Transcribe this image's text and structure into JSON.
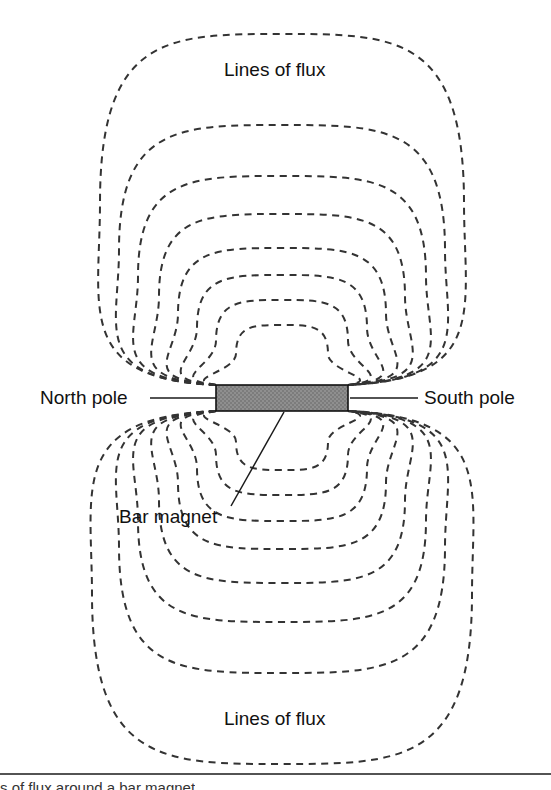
{
  "figure": {
    "kind": "magnetic-field-diagram",
    "background_color": "#ffffff",
    "line_color": "#333333",
    "magnet_fill": "#8a8a8a",
    "magnet_stroke": "#111111",
    "text_color": "#111111"
  },
  "labels": {
    "flux_top": "Lines of flux",
    "flux_bottom": "Lines of flux",
    "north_pole": "North pole",
    "south_pole": "South pole",
    "bar_magnet": "Bar magnet"
  },
  "caption": {
    "text": "s of flux around a bar magnet"
  },
  "chart_data": {
    "type": "diagram",
    "annotations": [
      {
        "text": "Lines of flux",
        "x": 275,
        "y": 70,
        "anchor": "middle"
      },
      {
        "text": "Lines of flux",
        "x": 275,
        "y": 719,
        "anchor": "middle"
      },
      {
        "text": "North pole",
        "x": 40,
        "y": 398,
        "anchor": "start"
      },
      {
        "text": "South pole",
        "x": 424,
        "y": 398,
        "anchor": "start"
      },
      {
        "text": "Bar magnet",
        "x": 119,
        "y": 517,
        "anchor": "start"
      }
    ],
    "magnet": {
      "x": 216,
      "y": 385,
      "width": 132,
      "height": 26,
      "fill": "#8a8a8a",
      "label": "Bar magnet",
      "north_end_x": 216,
      "south_end_x": 348
    },
    "leader_lines": [
      {
        "name": "north-pole-leader",
        "x1": 150,
        "y1": 398,
        "x2": 216,
        "y2": 398
      },
      {
        "name": "south-pole-leader",
        "x1": 350,
        "y1": 398,
        "x2": 418,
        "y2": 398
      },
      {
        "name": "bar-magnet-leader",
        "x1": 231,
        "y1": 506,
        "x2": 284,
        "y2": 412
      }
    ],
    "flux_loops_upper": [
      {
        "index": 1,
        "peak_y": 325,
        "half_width": 46
      },
      {
        "index": 2,
        "peak_y": 300,
        "half_width": 66
      },
      {
        "index": 3,
        "peak_y": 275,
        "half_width": 85
      },
      {
        "index": 4,
        "peak_y": 248,
        "half_width": 104
      },
      {
        "index": 5,
        "peak_y": 214,
        "half_width": 123
      },
      {
        "index": 6,
        "peak_y": 176,
        "half_width": 144
      },
      {
        "index": 7,
        "peak_y": 125,
        "half_width": 163
      },
      {
        "index": 8,
        "peak_y": 34,
        "half_width": 182
      }
    ],
    "flux_loops_lower": [
      {
        "index": 1,
        "peak_y": 470,
        "half_width": 46
      },
      {
        "index": 2,
        "peak_y": 495,
        "half_width": 66
      },
      {
        "index": 3,
        "peak_y": 521,
        "half_width": 85
      },
      {
        "index": 4,
        "peak_y": 549,
        "half_width": 104
      },
      {
        "index": 5,
        "peak_y": 583,
        "half_width": 123
      },
      {
        "index": 6,
        "peak_y": 622,
        "half_width": 144
      },
      {
        "index": 7,
        "peak_y": 673,
        "half_width": 163
      },
      {
        "index": 8,
        "peak_y": 764,
        "half_width": 190
      }
    ],
    "caption_rule": {
      "x1": 0,
      "y1": 774,
      "x2": 551,
      "y2": 774
    },
    "xlim": [
      0,
      551
    ],
    "ylim": [
      0,
      790
    ],
    "grid": false,
    "legend": null
  }
}
